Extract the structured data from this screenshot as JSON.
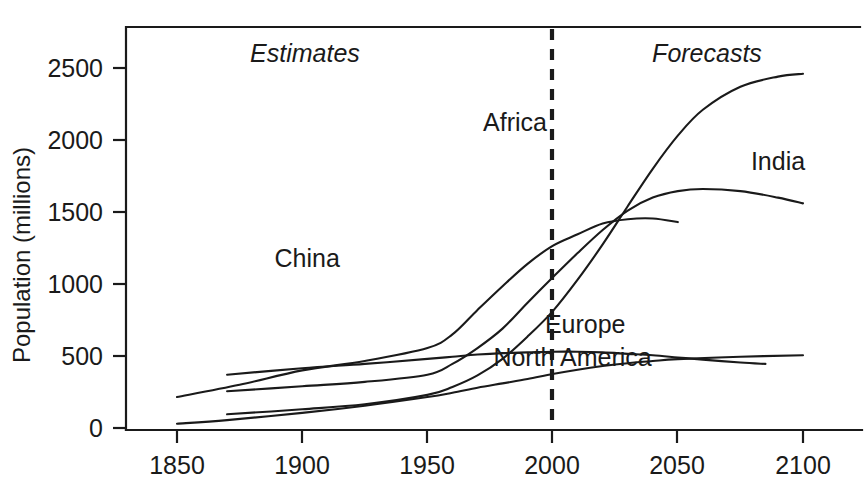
{
  "chart_data": {
    "type": "line",
    "title": "",
    "xlabel": "",
    "ylabel": "Population (millions)",
    "xlim": [
      1840,
      2110
    ],
    "ylim": [
      0,
      2800
    ],
    "xticks": [
      "1850",
      "1900",
      "1950",
      "2000",
      "2050",
      "2100"
    ],
    "xtick_values": [
      1850,
      1900,
      1950,
      2000,
      2050,
      2100
    ],
    "yticks": [
      "0",
      "500",
      "1000",
      "1500",
      "2000",
      "2500"
    ],
    "ytick_values": [
      0,
      500,
      1000,
      1500,
      2000,
      2500
    ],
    "grid": false,
    "legend": "inline-curve-labels",
    "annotations": [
      {
        "text": "Estimates",
        "x": 1910,
        "y": 2620,
        "style": "italic"
      },
      {
        "text": "Forecasts",
        "x": 2058,
        "y": 2620,
        "style": "italic"
      },
      {
        "text": "vertical dashed divider at year 2000",
        "x": 2000,
        "y": null,
        "style": "dashed-line"
      }
    ],
    "divider_year": 2000,
    "series": [
      {
        "name": "China",
        "label_x": 1902,
        "label_y": 1120,
        "x": [
          1850,
          1875,
          1900,
          1925,
          1950,
          1960,
          1970,
          1980,
          1990,
          2000,
          2010,
          2020,
          2030,
          2040,
          2050
        ],
        "values": [
          215,
          300,
          400,
          465,
          555,
          650,
          820,
          985,
          1140,
          1265,
          1345,
          1420,
          1450,
          1455,
          1430
        ]
      },
      {
        "name": "India",
        "label_x": 2090,
        "label_y": 1790,
        "x": [
          1870,
          1900,
          1925,
          1950,
          1960,
          1970,
          1980,
          1990,
          2000,
          2010,
          2020,
          2030,
          2040,
          2050,
          2060,
          2075,
          2090,
          2100
        ],
        "values": [
          255,
          290,
          320,
          370,
          445,
          555,
          690,
          870,
          1045,
          1215,
          1375,
          1510,
          1600,
          1645,
          1660,
          1645,
          1600,
          1560
        ]
      },
      {
        "name": "Africa",
        "label_x": 1985,
        "label_y": 2060,
        "x": [
          1870,
          1900,
          1925,
          1950,
          1960,
          1970,
          1980,
          1990,
          2000,
          2010,
          2020,
          2030,
          2040,
          2050,
          2060,
          2075,
          2090,
          2100
        ],
        "values": [
          95,
          130,
          165,
          230,
          285,
          365,
          480,
          635,
          810,
          1030,
          1275,
          1540,
          1800,
          2030,
          2210,
          2370,
          2440,
          2460
        ]
      },
      {
        "name": "Europe",
        "label_x": 2013,
        "label_y": 660,
        "x": [
          1870,
          1900,
          1925,
          1950,
          1960,
          1970,
          1980,
          1990,
          2000,
          2010,
          2020,
          2030,
          2040,
          2050,
          2060,
          2075,
          2085
        ],
        "values": [
          370,
          415,
          445,
          480,
          495,
          510,
          520,
          525,
          530,
          530,
          525,
          515,
          505,
          490,
          475,
          455,
          445
        ]
      },
      {
        "name": "North America",
        "label_x": 2008,
        "label_y": 430,
        "x": [
          1850,
          1870,
          1900,
          1925,
          1950,
          1960,
          1970,
          1980,
          1990,
          2000,
          2010,
          2020,
          2030,
          2040,
          2050,
          2075,
          2100
        ],
        "values": [
          30,
          55,
          105,
          155,
          215,
          245,
          280,
          310,
          340,
          375,
          405,
          430,
          450,
          465,
          478,
          495,
          505
        ]
      }
    ]
  }
}
